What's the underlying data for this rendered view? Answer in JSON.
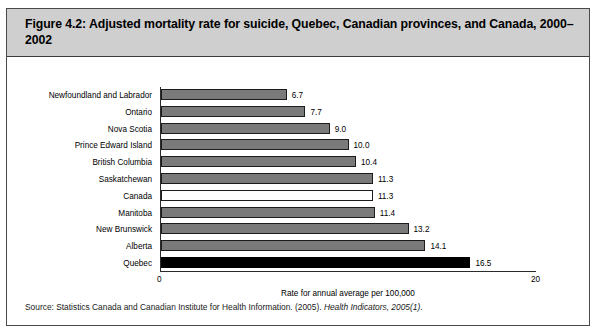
{
  "figure": {
    "title": "Figure 4.2: Adjusted mortality rate for suicide, Quebec, Canadian provinces, and Canada, 2000–2002",
    "source_prefix": "Source: Statistics Canada and Canadian Institute for Health Information. (2005). ",
    "source_italic": "Health Indicators, 2005(1)",
    "source_suffix": "."
  },
  "chart_data": {
    "type": "bar",
    "orientation": "horizontal",
    "title": "Figure 4.2: Adjusted mortality rate for suicide, Quebec, Canadian provinces, and Canada, 2000–2002",
    "xlabel": "Rate for annual average per 100,000",
    "ylabel": "",
    "xlim": [
      0,
      20
    ],
    "xticks": [
      "0",
      "20"
    ],
    "grid": false,
    "legend": false,
    "categories": [
      "Newfoundland and Labrador",
      "Ontario",
      "Nova Scotia",
      "Prince Edward Island",
      "British Columbia",
      "Saskatchewan",
      "Canada",
      "Manitoba",
      "New Brunswick",
      "Alberta",
      "Quebec"
    ],
    "values": [
      6.7,
      7.7,
      9.0,
      10.0,
      10.4,
      11.3,
      11.3,
      11.4,
      13.2,
      14.1,
      16.5
    ],
    "value_labels": [
      "6.7",
      "7.7",
      "9.0",
      "10.0",
      "10.4",
      "11.3",
      "11.3",
      "11.4",
      "13.2",
      "14.1",
      "16.5"
    ],
    "bar_styles": [
      "gray",
      "gray",
      "gray",
      "gray",
      "gray",
      "gray",
      "white",
      "gray",
      "gray",
      "gray",
      "black"
    ],
    "colors": {
      "bar_gray": "#7a7a7a",
      "bar_white": "#ffffff",
      "bar_black": "#000000",
      "bar_border": "#1c1c1c",
      "axis": "#2b2b2b",
      "title_banner": "#cfcfcf",
      "figure_border": "#4a4a4a"
    }
  }
}
